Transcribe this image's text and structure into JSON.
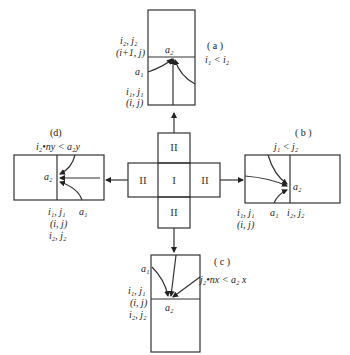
{
  "diagram": {
    "center": {
      "cells": {
        "top": "II",
        "left": "II",
        "middle": "I",
        "right": "II",
        "bottom": "II"
      }
    },
    "panels": {
      "a": {
        "title": "( a )",
        "condition": "i₁ < i₂",
        "labels": {
          "upper_ij": "i₂, j₂",
          "upper_coord": "(i+1, j)",
          "a1": "a₁",
          "a2": "a₂",
          "lower_ij": "i₁, j₁",
          "lower_coord": "(i, j)"
        }
      },
      "b": {
        "title": "( b )",
        "condition": "j₁ < j₂",
        "labels": {
          "a2": "a₂",
          "ij1": "i₁, j₁",
          "coord": "(i, j)",
          "a1": "a₁",
          "ij2": "i₂, j₂"
        }
      },
      "c": {
        "title": "( c )",
        "condition": "j₂•nx < a₂ x",
        "labels": {
          "a1": "a₁",
          "ij1": "i₁, j₁",
          "coord": "(i, j)",
          "ij2": "i₂, j₂",
          "a2": "a₂"
        }
      },
      "d": {
        "title": "(d)",
        "condition": "i₂•ny < a₂y",
        "labels": {
          "a2": "a₂",
          "ij1": "i₁, j₁",
          "a1": "a₁",
          "coord": "(i, j)",
          "ij2": "i₂, j₂"
        }
      }
    }
  }
}
